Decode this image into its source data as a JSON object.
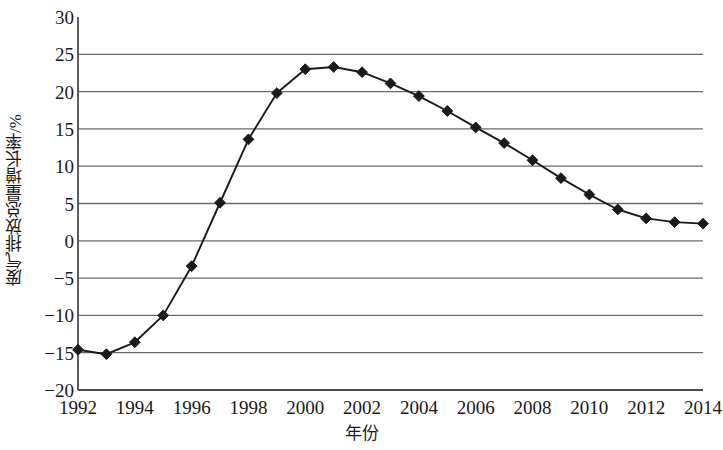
{
  "chart_data": {
    "type": "line",
    "title": "",
    "xlabel": "年份",
    "ylabel": "废气排放总量增长率/%",
    "xlim": [
      1992,
      2014
    ],
    "ylim": [
      -20,
      30
    ],
    "grid": true,
    "legend": "none",
    "marker": "diamond",
    "line_color": "#1a1a1a",
    "marker_color": "#1a1a1a",
    "grid_color": "#6b6b6b",
    "axis_color": "#4d4d4d",
    "x": [
      1992,
      1993,
      1994,
      1995,
      1996,
      1997,
      1998,
      1999,
      2000,
      2001,
      2002,
      2003,
      2004,
      2005,
      2006,
      2007,
      2008,
      2009,
      2010,
      2011,
      2012,
      2013,
      2014
    ],
    "values": [
      -14.6,
      -15.2,
      -13.6,
      -10.0,
      -3.4,
      5.1,
      13.6,
      19.8,
      23.0,
      23.3,
      22.6,
      21.1,
      19.4,
      17.4,
      15.2,
      13.1,
      10.8,
      8.4,
      6.2,
      4.2,
      3.0,
      2.5,
      2.3
    ],
    "y_tick_labels": [
      "30",
      "25",
      "20",
      "15",
      "10",
      "5",
      "0",
      "−5",
      "−10",
      "−15",
      "−20"
    ],
    "y_tick_values": [
      30,
      25,
      20,
      15,
      10,
      5,
      0,
      -5,
      -10,
      -15,
      -20
    ],
    "x_tick_labels": [
      "1992",
      "1994",
      "1996",
      "1998",
      "2000",
      "2002",
      "2004",
      "2006",
      "2008",
      "2010",
      "2012",
      "2014"
    ],
    "x_tick_values": [
      1992,
      1994,
      1996,
      1998,
      2000,
      2002,
      2004,
      2006,
      2008,
      2010,
      2012,
      2014
    ]
  }
}
